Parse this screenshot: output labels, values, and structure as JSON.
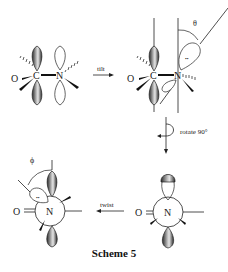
{
  "caption": "Scheme 5",
  "arrows": {
    "tilt": "tilt",
    "rotate": "rotate 90°",
    "twist": "twist"
  },
  "angles": {
    "theta": "θ",
    "phi": "ϕ"
  },
  "structures": [
    {
      "id": "planar-amide",
      "atoms": {
        "O": "O",
        "C": "C",
        "N": "N"
      }
    },
    {
      "id": "tilted-amide",
      "atoms": {
        "O": "O",
        "C": "C",
        "N": "N"
      }
    },
    {
      "id": "rotated-newman",
      "atoms": {
        "O": "O",
        "N": "N"
      }
    },
    {
      "id": "twisted-newman",
      "atoms": {
        "O": "O",
        "N": "N"
      }
    }
  ],
  "lone_pair_symbol": "••",
  "colors": {
    "ink": "#222222",
    "lobe_fill_dark": "#3a3a3a",
    "lobe_fill_light": "#cfcfcf",
    "background": "#ffffff"
  }
}
